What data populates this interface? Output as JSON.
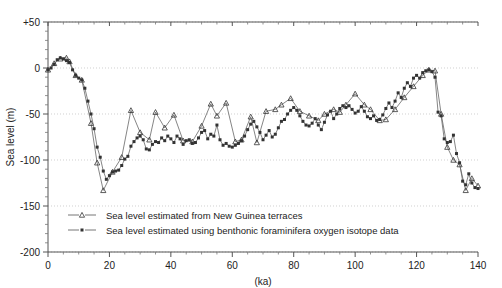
{
  "chart_data": {
    "type": "line",
    "title": "",
    "xlabel": "(ka)",
    "ylabel": "Sea level (m)",
    "xlim": [
      0,
      140
    ],
    "ylim": [
      -200,
      50
    ],
    "xticks": [
      0,
      20,
      40,
      60,
      80,
      100,
      120,
      140
    ],
    "xticklabels": [
      "0",
      "20",
      "40",
      "60",
      "80",
      "100",
      "120",
      "140"
    ],
    "xminor_step": 5,
    "yticks": [
      50,
      0,
      -50,
      -100,
      -150,
      -200
    ],
    "yticklabels": [
      "+50",
      "0",
      "-50",
      "-100",
      "-150",
      "-200"
    ],
    "yminor_step": 10,
    "grid": "horizontal-dotted",
    "legend_position": "lower-left-inside",
    "line_color": "#666666",
    "marker_color": "#333333",
    "series": [
      {
        "name": "Sea level estimated from New Guinea terraces",
        "marker": "triangle",
        "points": [
          [
            0,
            -2
          ],
          [
            2,
            5
          ],
          [
            4,
            10
          ],
          [
            6,
            11
          ],
          [
            7,
            7
          ],
          [
            9,
            -8
          ],
          [
            11,
            -13
          ],
          [
            14,
            -60
          ],
          [
            16,
            -103
          ],
          [
            18,
            -133
          ],
          [
            21,
            -113
          ],
          [
            24,
            -97
          ],
          [
            27,
            -46
          ],
          [
            30,
            -70
          ],
          [
            33,
            -78
          ],
          [
            35,
            -48
          ],
          [
            38,
            -65
          ],
          [
            41,
            -51
          ],
          [
            44,
            -79
          ],
          [
            47,
            -80
          ],
          [
            50,
            -63
          ],
          [
            53,
            -39
          ],
          [
            55,
            -52
          ],
          [
            58,
            -38
          ],
          [
            61,
            -80
          ],
          [
            63,
            -78
          ],
          [
            66,
            -53
          ],
          [
            68,
            -81
          ],
          [
            71,
            -47
          ],
          [
            74,
            -45
          ],
          [
            76,
            -40
          ],
          [
            79,
            -33
          ],
          [
            82,
            -47
          ],
          [
            85,
            -52
          ],
          [
            88,
            -57
          ],
          [
            90,
            -50
          ],
          [
            93,
            -45
          ],
          [
            95,
            -48
          ],
          [
            97,
            -40
          ],
          [
            100,
            -28
          ],
          [
            103,
            -40
          ],
          [
            105,
            -45
          ],
          [
            108,
            -57
          ],
          [
            110,
            -56
          ],
          [
            113,
            -45
          ],
          [
            116,
            -32
          ],
          [
            119,
            -20
          ],
          [
            122,
            -8
          ],
          [
            124,
            -2
          ],
          [
            126,
            -3
          ],
          [
            128,
            -50
          ],
          [
            130,
            -86
          ],
          [
            132,
            -100
          ],
          [
            134,
            -105
          ],
          [
            136,
            -133
          ],
          [
            138,
            -120
          ],
          [
            140,
            -128
          ]
        ]
      },
      {
        "name": "Sea level estimated using benthonic foraminifera oxygen isotope data",
        "marker": "square",
        "points": [
          [
            0,
            -2
          ],
          [
            1,
            0
          ],
          [
            2,
            4
          ],
          [
            3,
            9
          ],
          [
            4,
            11
          ],
          [
            5,
            10
          ],
          [
            6,
            8
          ],
          [
            7,
            6
          ],
          [
            8,
            -2
          ],
          [
            9,
            -8
          ],
          [
            10,
            -11
          ],
          [
            11,
            -13
          ],
          [
            12,
            -22
          ],
          [
            13,
            -36
          ],
          [
            14,
            -50
          ],
          [
            15,
            -66
          ],
          [
            16,
            -86
          ],
          [
            17,
            -97
          ],
          [
            18,
            -112
          ],
          [
            19,
            -121
          ],
          [
            20,
            -117
          ],
          [
            21,
            -113
          ],
          [
            22,
            -112
          ],
          [
            23,
            -111
          ],
          [
            24,
            -106
          ],
          [
            25,
            -99
          ],
          [
            26,
            -96
          ],
          [
            27,
            -85
          ],
          [
            28,
            -80
          ],
          [
            29,
            -76
          ],
          [
            30,
            -74
          ],
          [
            31,
            -78
          ],
          [
            32,
            -88
          ],
          [
            33,
            -89
          ],
          [
            34,
            -83
          ],
          [
            35,
            -80
          ],
          [
            36,
            -81
          ],
          [
            37,
            -76
          ],
          [
            38,
            -79
          ],
          [
            39,
            -74
          ],
          [
            40,
            -77
          ],
          [
            41,
            -81
          ],
          [
            42,
            -74
          ],
          [
            43,
            -77
          ],
          [
            44,
            -83
          ],
          [
            45,
            -79
          ],
          [
            46,
            -78
          ],
          [
            47,
            -82
          ],
          [
            48,
            -81
          ],
          [
            49,
            -76
          ],
          [
            50,
            -70
          ],
          [
            51,
            -68
          ],
          [
            52,
            -77
          ],
          [
            53,
            -72
          ],
          [
            54,
            -74
          ],
          [
            55,
            -62
          ],
          [
            56,
            -78
          ],
          [
            57,
            -84
          ],
          [
            58,
            -82
          ],
          [
            59,
            -85
          ],
          [
            60,
            -86
          ],
          [
            61,
            -84
          ],
          [
            62,
            -82
          ],
          [
            63,
            -79
          ],
          [
            64,
            -74
          ],
          [
            65,
            -67
          ],
          [
            66,
            -61
          ],
          [
            67,
            -58
          ],
          [
            68,
            -64
          ],
          [
            69,
            -70
          ],
          [
            70,
            -78
          ],
          [
            71,
            -73
          ],
          [
            72,
            -68
          ],
          [
            73,
            -75
          ],
          [
            74,
            -72
          ],
          [
            75,
            -65
          ],
          [
            76,
            -58
          ],
          [
            77,
            -56
          ],
          [
            78,
            -50
          ],
          [
            79,
            -46
          ],
          [
            80,
            -43
          ],
          [
            81,
            -46
          ],
          [
            82,
            -52
          ],
          [
            83,
            -58
          ],
          [
            84,
            -62
          ],
          [
            85,
            -63
          ],
          [
            86,
            -60
          ],
          [
            87,
            -55
          ],
          [
            88,
            -62
          ],
          [
            89,
            -67
          ],
          [
            90,
            -59
          ],
          [
            91,
            -51
          ],
          [
            92,
            -47
          ],
          [
            93,
            -55
          ],
          [
            94,
            -50
          ],
          [
            95,
            -44
          ],
          [
            96,
            -41
          ],
          [
            97,
            -43
          ],
          [
            98,
            -41
          ],
          [
            99,
            -45
          ],
          [
            100,
            -49
          ],
          [
            101,
            -47
          ],
          [
            102,
            -42
          ],
          [
            103,
            -47
          ],
          [
            104,
            -53
          ],
          [
            105,
            -55
          ],
          [
            106,
            -52
          ],
          [
            107,
            -57
          ],
          [
            108,
            -56
          ],
          [
            109,
            -51
          ],
          [
            110,
            -44
          ],
          [
            111,
            -38
          ],
          [
            112,
            -43
          ],
          [
            113,
            -36
          ],
          [
            114,
            -27
          ],
          [
            115,
            -32
          ],
          [
            116,
            -22
          ],
          [
            117,
            -16
          ],
          [
            118,
            -20
          ],
          [
            119,
            -11
          ],
          [
            120,
            -8
          ],
          [
            121,
            -11
          ],
          [
            122,
            -5
          ],
          [
            123,
            -3
          ],
          [
            124,
            -2
          ],
          [
            125,
            -4
          ],
          [
            126,
            -10
          ],
          [
            127,
            -48
          ],
          [
            128,
            -52
          ],
          [
            129,
            -77
          ],
          [
            130,
            -81
          ],
          [
            131,
            -80
          ],
          [
            132,
            -73
          ],
          [
            133,
            -93
          ],
          [
            134,
            -103
          ],
          [
            135,
            -123
          ],
          [
            136,
            -127
          ],
          [
            137,
            -115
          ],
          [
            138,
            -125
          ],
          [
            139,
            -130
          ],
          [
            140,
            -131
          ]
        ]
      }
    ],
    "legend": [
      {
        "label": "Sea level estimated from New Guinea terraces",
        "marker": "triangle"
      },
      {
        "label": "Sea level estimated using benthonic foraminifera oxygen isotope data",
        "marker": "square"
      }
    ]
  }
}
